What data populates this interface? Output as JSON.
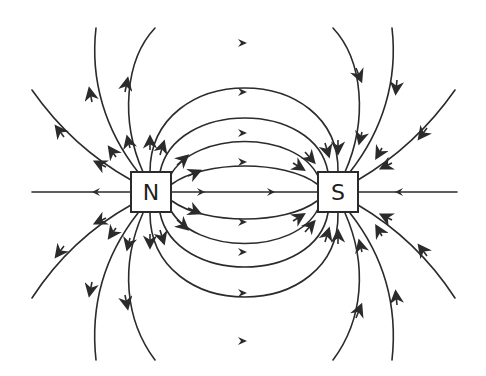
{
  "diagram": {
    "poles": [
      {
        "id": "north",
        "label": "N"
      },
      {
        "id": "south",
        "label": "S"
      }
    ],
    "line_color": "#2b2b2b",
    "background": "#ffffff",
    "field_direction": "from N to S"
  }
}
